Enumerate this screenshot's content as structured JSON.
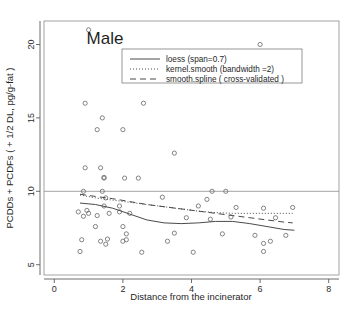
{
  "chart_data": {
    "type": "scatter",
    "title": "Male",
    "xlabel": "Distance from the incinerator",
    "ylabel": "PCDDs + PCDFs ( + 1/2 DL, pg/g-fat )",
    "xlim": [
      -0.3,
      8.3
    ],
    "ylim": [
      4.3,
      21.6
    ],
    "xticks": [
      0,
      2,
      4,
      6,
      8
    ],
    "xtick_labels": [
      "0",
      "2",
      "4",
      "6",
      "8"
    ],
    "yticks": [
      5,
      10,
      15,
      20
    ],
    "ytick_labels": [
      "5",
      "10",
      "15",
      "20"
    ],
    "grid": false,
    "reference_line": {
      "orientation": "horizontal",
      "y": 10
    },
    "points": [
      [
        1.0,
        21.0
      ],
      [
        6.0,
        20.0
      ],
      [
        0.9,
        16.0
      ],
      [
        2.6,
        16.0
      ],
      [
        1.4,
        15.0
      ],
      [
        1.25,
        14.2
      ],
      [
        2.0,
        14.2
      ],
      [
        3.5,
        12.6
      ],
      [
        0.9,
        11.6
      ],
      [
        1.35,
        11.6
      ],
      [
        1.45,
        10.9
      ],
      [
        1.45,
        10.95
      ],
      [
        2.05,
        10.9
      ],
      [
        2.45,
        10.9
      ],
      [
        0.85,
        10.0
      ],
      [
        1.4,
        10.0
      ],
      [
        4.6,
        10.0
      ],
      [
        5.0,
        10.0
      ],
      [
        1.5,
        9.55
      ],
      [
        3.15,
        9.6
      ],
      [
        4.45,
        9.45
      ],
      [
        1.45,
        9.0
      ],
      [
        1.9,
        9.0
      ],
      [
        4.2,
        9.0
      ],
      [
        5.3,
        8.9
      ],
      [
        6.1,
        8.85
      ],
      [
        6.95,
        8.9
      ],
      [
        0.7,
        8.6
      ],
      [
        0.95,
        8.7
      ],
      [
        1.0,
        8.5
      ],
      [
        1.6,
        8.5
      ],
      [
        1.9,
        8.6
      ],
      [
        2.2,
        8.5
      ],
      [
        0.85,
        8.3
      ],
      [
        1.25,
        8.35
      ],
      [
        3.85,
        8.2
      ],
      [
        4.55,
        8.1
      ],
      [
        5.15,
        8.25
      ],
      [
        6.45,
        8.2
      ],
      [
        1.2,
        7.6
      ],
      [
        2.0,
        7.6
      ],
      [
        2.1,
        7.1
      ],
      [
        3.5,
        7.15
      ],
      [
        4.9,
        7.1
      ],
      [
        5.85,
        7.0
      ],
      [
        6.75,
        7.0
      ],
      [
        0.8,
        6.7
      ],
      [
        1.35,
        6.6
      ],
      [
        1.55,
        6.75
      ],
      [
        2.0,
        6.6
      ],
      [
        2.1,
        6.7
      ],
      [
        3.3,
        6.6
      ],
      [
        1.5,
        6.4
      ],
      [
        6.1,
        6.45
      ],
      [
        6.3,
        6.6
      ],
      [
        0.75,
        5.9
      ],
      [
        2.55,
        5.85
      ],
      [
        4.05,
        5.85
      ],
      [
        6.1,
        5.9
      ]
    ],
    "series": [
      {
        "name": "loess (span=0.7)",
        "style": "solid",
        "x": [
          0.75,
          1.2,
          1.7,
          2.2,
          2.7,
          3.2,
          3.7,
          4.2,
          4.7,
          5.2,
          5.7,
          6.2,
          6.7,
          7.0
        ],
        "y": [
          9.2,
          9.1,
          8.85,
          8.45,
          8.05,
          7.85,
          7.8,
          7.85,
          7.95,
          7.95,
          7.8,
          7.6,
          7.4,
          7.35
        ]
      },
      {
        "name": "kernel.smooth (bandwidth =2)",
        "style": "dotted",
        "x": [
          0.75,
          1.2,
          1.7,
          2.2,
          2.7,
          3.2,
          3.7,
          4.2,
          4.7,
          5.2,
          5.7,
          6.2,
          6.7,
          6.95
        ],
        "y": [
          9.75,
          9.55,
          9.4,
          9.25,
          9.1,
          8.95,
          8.8,
          8.65,
          8.55,
          8.5,
          8.5,
          8.5,
          8.5,
          8.5
        ]
      },
      {
        "name": "smooth.spline ( cross-validated )",
        "style": "dashed",
        "x": [
          0.75,
          1.2,
          1.7,
          2.2,
          2.7,
          3.2,
          3.7,
          4.2,
          4.7,
          5.2,
          5.7,
          6.2,
          6.7,
          6.95
        ],
        "y": [
          9.8,
          9.65,
          9.5,
          9.3,
          9.1,
          8.95,
          8.8,
          8.65,
          8.5,
          8.35,
          8.2,
          8.05,
          7.9,
          7.85
        ]
      }
    ],
    "legend": {
      "position": "top-center",
      "entries": [
        {
          "label": "loess (span=0.7)",
          "style": "solid"
        },
        {
          "label": "kernel.smooth (bandwidth =2)",
          "style": "dotted"
        },
        {
          "label": "smooth.spline ( cross-validated )",
          "style": "dashed"
        }
      ]
    }
  }
}
